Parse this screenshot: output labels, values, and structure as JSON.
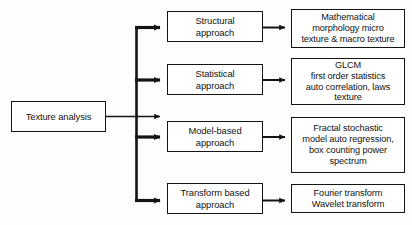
{
  "diagram": {
    "type": "flowchart",
    "orientation": "left-to-right",
    "background_color": "#fdfdfd",
    "line_color": "#141414",
    "text_color": "#131313",
    "root": {
      "label": "Texture analysis"
    },
    "branches": [
      {
        "approach": "Structural\napproach",
        "details": "Mathematical\nmorphology micro\ntexture & macro texture"
      },
      {
        "approach": "Statistical\napproach",
        "details": "GLCM\nfirst order statistics\nauto correlation, laws\ntexture"
      },
      {
        "approach": "Model-based\napproach",
        "details": "Fractal stochastic\nmodel auto regression,\nbox counting power\nspectrum"
      },
      {
        "approach": "Transform based\napproach",
        "details": "Fourier transform\nWavelet transform"
      }
    ]
  }
}
